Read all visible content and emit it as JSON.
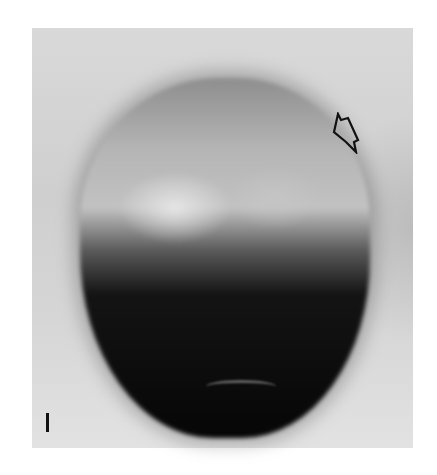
{
  "image": {
    "description": "Grayscale micrograph of a rounded specimen, light upper region and dark lower region",
    "colors": {
      "background": "#ffffff",
      "frame": "#d6d6d6",
      "specimen_light": "#c2c2c2",
      "specimen_dark": "#060606"
    },
    "annotations": {
      "arrow": "open-arrow-pointing-down-left",
      "scale_bar": "vertical-scale-bar"
    }
  }
}
